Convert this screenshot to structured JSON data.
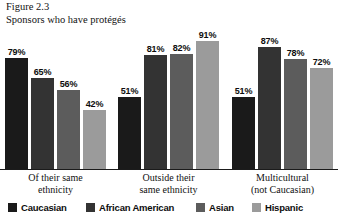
{
  "figure": {
    "number_label": "Figure 2.3",
    "caption": "Sponsors who have protégés"
  },
  "chart_data": {
    "type": "bar",
    "title": "Sponsors who have protégés",
    "subtitle": "Figure 2.3",
    "xlabel": "",
    "ylabel": "",
    "ylim": [
      0,
      100
    ],
    "grid": false,
    "legend_position": "bottom",
    "value_suffix": "%",
    "categories": [
      "Of their same ethnicity",
      "Outside their same ethnicity",
      "Multicultural (not Caucasian)"
    ],
    "category_lines": [
      [
        "Of their same",
        "ethnicity"
      ],
      [
        "Outside their",
        "same ethnicity"
      ],
      [
        "Multicultural",
        "(not Caucasian)"
      ]
    ],
    "series": [
      {
        "name": "Caucasian",
        "color": "#1a1a1a",
        "values": [
          79,
          51,
          51
        ],
        "labels": [
          "79%",
          "51%",
          "51%"
        ]
      },
      {
        "name": "African American",
        "color": "#333333",
        "values": [
          65,
          81,
          87
        ],
        "labels": [
          "65%",
          "81%",
          "87%"
        ]
      },
      {
        "name": "Asian",
        "color": "#5c5c5c",
        "values": [
          56,
          82,
          78
        ],
        "labels": [
          "56%",
          "82%",
          "78%"
        ]
      },
      {
        "name": "Hispanic",
        "color": "#9b9b9b",
        "values": [
          42,
          91,
          72
        ],
        "labels": [
          "42%",
          "91%",
          "72%"
        ]
      }
    ]
  },
  "legend": {
    "items": [
      {
        "label": "Caucasian",
        "color": "#1a1a1a"
      },
      {
        "label": "African American",
        "color": "#333333"
      },
      {
        "label": "Asian",
        "color": "#5c5c5c"
      },
      {
        "label": "Hispanic",
        "color": "#9b9b9b"
      }
    ]
  }
}
